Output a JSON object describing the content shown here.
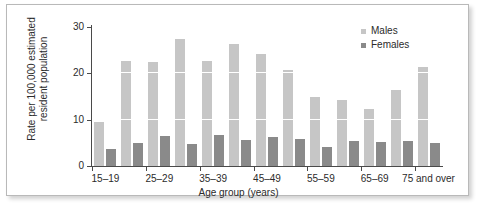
{
  "chart_data": {
    "type": "bar",
    "title": "",
    "xlabel": "Age group (years)",
    "ylabel": "Rate per 100,000 estimated resident population",
    "ylim": [
      0,
      30
    ],
    "yticks": [
      0,
      10,
      20,
      30
    ],
    "grid": "horizontal white gridlines at 10 and 20",
    "legend_position": "top-right",
    "categories": [
      "15–19",
      "20–24",
      "25–29",
      "30–34",
      "35–39",
      "40–44",
      "45–49",
      "50–54",
      "55–59",
      "60–64",
      "65–69",
      "70–74",
      "75 and over"
    ],
    "visible_tick_labels": [
      "15–19",
      "25–29",
      "35–39",
      "45–49",
      "55–59",
      "65–69",
      "75 and over"
    ],
    "series": [
      {
        "name": "Males",
        "color": "#c6c6c6",
        "values": [
          9.5,
          22.6,
          22.4,
          27.5,
          22.6,
          26.4,
          24.2,
          20.7,
          14.9,
          14.3,
          12.3,
          16.3,
          21.3
        ]
      },
      {
        "name": "Females",
        "color": "#8a8a8a",
        "values": [
          3.6,
          4.9,
          6.4,
          4.7,
          6.8,
          5.6,
          6.2,
          5.8,
          4.0,
          5.4,
          5.2,
          5.4,
          5.0
        ]
      }
    ]
  },
  "legend": {
    "items": [
      {
        "label": "Males",
        "swatch": "male"
      },
      {
        "label": "Females",
        "swatch": "female"
      }
    ]
  },
  "axes": {
    "y_tick_labels": [
      "30",
      "20",
      "10",
      "0"
    ],
    "y_title": "Rate per 100,000 estimated resident population",
    "x_title": "Age group (years)"
  }
}
